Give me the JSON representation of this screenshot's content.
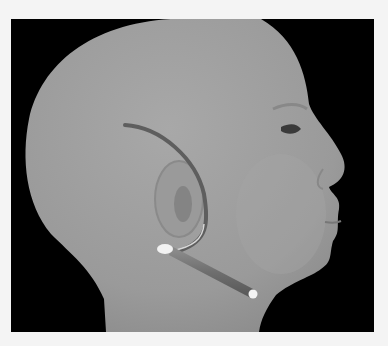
{
  "figure": {
    "colors": {
      "background": "#000000",
      "frame": "#f4f4f4",
      "skin": "#9c9c9c",
      "lead": "#707070",
      "lead_tip": "#f2f2f2"
    }
  }
}
